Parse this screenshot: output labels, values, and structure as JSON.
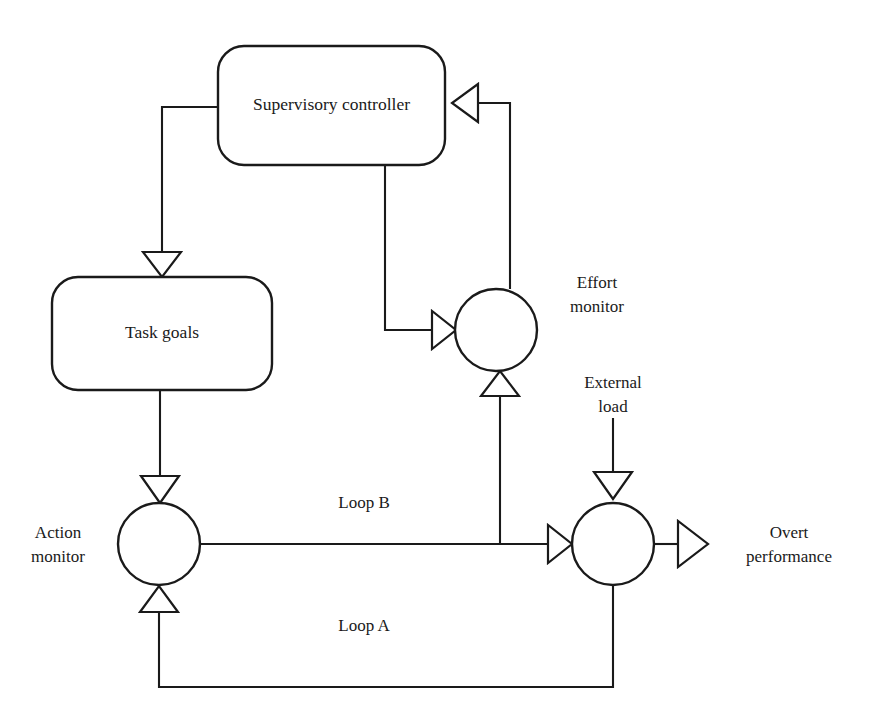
{
  "diagram": {
    "background_color": "#ffffff",
    "line_color": "#1a1a1a",
    "nodes": [
      {
        "id": "supervisory-controller",
        "type": "rounded-box",
        "label": "Supervisory controller",
        "x": 218,
        "y": 46,
        "width": 227,
        "height": 119,
        "rx": 26
      },
      {
        "id": "task-goals",
        "type": "rounded-box",
        "label": "Task goals",
        "x": 52,
        "y": 277,
        "width": 220,
        "height": 113,
        "rx": 26
      },
      {
        "id": "effort-monitor",
        "type": "circle",
        "label": "Effort monitor",
        "label_lines": [
          "Effort",
          "monitor"
        ],
        "cx": 496,
        "cy": 330,
        "r": 41
      },
      {
        "id": "action-monitor",
        "type": "circle",
        "label": "Action monitor",
        "label_lines": [
          "Action",
          "monitor"
        ],
        "cx": 159,
        "cy": 544,
        "r": 41
      },
      {
        "id": "performance-summer",
        "type": "circle",
        "label": "Overt performance",
        "label_lines": [
          "Overt",
          "performance"
        ],
        "cx": 613,
        "cy": 544,
        "r": 41
      }
    ],
    "external_inputs": [
      {
        "id": "external-load",
        "label": "External load",
        "label_lines": [
          "External",
          "load"
        ],
        "target": "performance-summer"
      }
    ],
    "outputs": [
      {
        "id": "overt-performance",
        "label": "Overt performance",
        "label_lines": [
          "Overt",
          "performance"
        ],
        "source": "performance-summer"
      }
    ],
    "loop_labels": [
      {
        "id": "loop-b",
        "label": "Loop B",
        "x": 364,
        "y": 508
      },
      {
        "id": "loop-a",
        "label": "Loop A",
        "x": 364,
        "y": 631
      }
    ],
    "edges": [
      {
        "id": "edge-supervisory-to-task-goals",
        "from": "supervisory-controller",
        "to": "task-goals",
        "arrow": "down"
      },
      {
        "id": "edge-supervisory-to-effort-monitor",
        "from": "supervisory-controller",
        "to": "effort-monitor",
        "arrow": "right"
      },
      {
        "id": "edge-effort-monitor-to-supervisory",
        "from": "effort-monitor",
        "to": "supervisory-controller",
        "arrow": "left"
      },
      {
        "id": "edge-task-goals-to-action-monitor",
        "from": "task-goals",
        "to": "action-monitor",
        "arrow": "down"
      },
      {
        "id": "edge-action-monitor-to-performance",
        "from": "action-monitor",
        "to": "performance-summer",
        "arrow": "right"
      },
      {
        "id": "edge-loop-b-to-effort-monitor",
        "from": "performance-summer",
        "to": "effort-monitor",
        "arrow": "up",
        "label": "Loop B"
      },
      {
        "id": "edge-loop-a-to-action-monitor",
        "from": "performance-summer",
        "to": "action-monitor",
        "arrow": "up",
        "label": "Loop A"
      },
      {
        "id": "edge-external-load-to-performance",
        "from": "external-load",
        "to": "performance-summer",
        "arrow": "down"
      },
      {
        "id": "edge-performance-to-overt",
        "from": "performance-summer",
        "to": "overt-performance",
        "arrow": "right"
      }
    ]
  }
}
